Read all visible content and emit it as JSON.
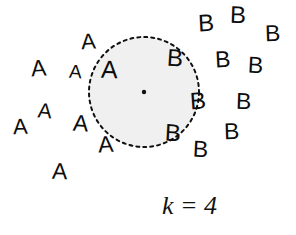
{
  "figure": {
    "width": 296,
    "height": 235,
    "background_color": "#ffffff",
    "caption": "k = 4"
  },
  "neighborhood": {
    "shape": "dashed-circle",
    "center_x": 144,
    "center_y": 92,
    "radius": 55,
    "fill_color": "#f0f0f0",
    "stroke_color": "#111111",
    "stroke_width": 2,
    "dash_pattern": "3 4",
    "query_point": {
      "x": 144,
      "y": 92,
      "color": "#111111",
      "radius": 2.2
    }
  },
  "classes": [
    {
      "id": "a",
      "label": "A",
      "color": "#0d0d0d"
    },
    {
      "id": "b",
      "label": "B",
      "color": "#0d0d0d"
    }
  ],
  "points": [
    {
      "label": "A",
      "cls": "a",
      "x": 31,
      "y": 57,
      "size": 23,
      "rotate": -4,
      "inside": false
    },
    {
      "label": "A",
      "cls": "a",
      "x": 69,
      "y": 62,
      "size": 19,
      "rotate": 3,
      "inside": false
    },
    {
      "label": "A",
      "cls": "a",
      "x": 81,
      "y": 31,
      "size": 22,
      "rotate": -3,
      "inside": false
    },
    {
      "label": "A",
      "cls": "a",
      "x": 101,
      "y": 57,
      "size": 25,
      "rotate": 2,
      "inside": true
    },
    {
      "label": "A",
      "cls": "a",
      "x": 38,
      "y": 100,
      "size": 21,
      "rotate": 5,
      "inside": false
    },
    {
      "label": "A",
      "cls": "a",
      "x": 13,
      "y": 116,
      "size": 22,
      "rotate": -2,
      "inside": false
    },
    {
      "label": "A",
      "cls": "a",
      "x": 73,
      "y": 112,
      "size": 23,
      "rotate": 4,
      "inside": false
    },
    {
      "label": "A",
      "cls": "a",
      "x": 98,
      "y": 133,
      "size": 23,
      "rotate": -3,
      "inside": false
    },
    {
      "label": "A",
      "cls": "a",
      "x": 52,
      "y": 160,
      "size": 23,
      "rotate": 2,
      "inside": false
    },
    {
      "label": "B",
      "cls": "b",
      "x": 198,
      "y": 11,
      "size": 24,
      "rotate": -3,
      "inside": false
    },
    {
      "label": "B",
      "cls": "b",
      "x": 230,
      "y": 3,
      "size": 24,
      "rotate": 2,
      "inside": false
    },
    {
      "label": "B",
      "cls": "b",
      "x": 265,
      "y": 22,
      "size": 23,
      "rotate": -2,
      "inside": false
    },
    {
      "label": "B",
      "cls": "b",
      "x": 167,
      "y": 46,
      "size": 24,
      "rotate": 4,
      "inside": true
    },
    {
      "label": "B",
      "cls": "b",
      "x": 215,
      "y": 48,
      "size": 23,
      "rotate": -3,
      "inside": false
    },
    {
      "label": "B",
      "cls": "b",
      "x": 248,
      "y": 54,
      "size": 23,
      "rotate": 3,
      "inside": false
    },
    {
      "label": "B",
      "cls": "b",
      "x": 190,
      "y": 89,
      "size": 24,
      "rotate": -4,
      "inside": true
    },
    {
      "label": "B",
      "cls": "b",
      "x": 236,
      "y": 90,
      "size": 23,
      "rotate": 2,
      "inside": false
    },
    {
      "label": "B",
      "cls": "b",
      "x": 165,
      "y": 121,
      "size": 24,
      "rotate": 3,
      "inside": true
    },
    {
      "label": "B",
      "cls": "b",
      "x": 224,
      "y": 120,
      "size": 23,
      "rotate": -2,
      "inside": false
    },
    {
      "label": "B",
      "cls": "b",
      "x": 193,
      "y": 138,
      "size": 23,
      "rotate": 3,
      "inside": false
    }
  ],
  "caption": {
    "text": "k = 4",
    "x": 162,
    "y": 193,
    "size": 26
  },
  "chart_data": {
    "type": "scatter",
    "title": "",
    "subtitle": "",
    "xlabel": "",
    "ylabel": "",
    "annotations": [
      "k = 4"
    ],
    "legend_entries": [
      "A",
      "B"
    ],
    "grid": false,
    "xlim": [
      0,
      296
    ],
    "ylim": [
      0,
      235
    ],
    "series": [
      {
        "name": "A",
        "marker": "letter-A",
        "points": [
          {
            "x": 31,
            "y": 57
          },
          {
            "x": 69,
            "y": 62
          },
          {
            "x": 81,
            "y": 31
          },
          {
            "x": 101,
            "y": 57
          },
          {
            "x": 38,
            "y": 100
          },
          {
            "x": 13,
            "y": 116
          },
          {
            "x": 73,
            "y": 112
          },
          {
            "x": 98,
            "y": 133
          },
          {
            "x": 52,
            "y": 160
          }
        ]
      },
      {
        "name": "B",
        "marker": "letter-B",
        "points": [
          {
            "x": 198,
            "y": 11
          },
          {
            "x": 230,
            "y": 3
          },
          {
            "x": 265,
            "y": 22
          },
          {
            "x": 167,
            "y": 46
          },
          {
            "x": 215,
            "y": 48
          },
          {
            "x": 248,
            "y": 54
          },
          {
            "x": 190,
            "y": 89
          },
          {
            "x": 236,
            "y": 90
          },
          {
            "x": 165,
            "y": 121
          },
          {
            "x": 224,
            "y": 120
          },
          {
            "x": 193,
            "y": 138
          }
        ]
      }
    ],
    "neighborhood_circle": {
      "center": [
        144,
        92
      ],
      "radius": 55,
      "style": "dashed",
      "fill": "#f0f0f0"
    },
    "query_point": {
      "x": 144,
      "y": 92
    }
  }
}
